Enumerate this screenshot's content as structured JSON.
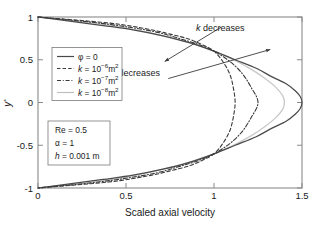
{
  "chart_data": {
    "type": "line",
    "title": "",
    "xlabel": "Scaled axial velocity",
    "ylabel": "y*",
    "xlim": [
      0,
      1.5
    ],
    "ylim": [
      -1,
      1
    ],
    "xticks": [
      "0",
      "0.5",
      "1",
      "1.5"
    ],
    "xtick_values": [
      0,
      0.5,
      1,
      1.5
    ],
    "yticks": [
      "1",
      "0.5",
      "0",
      "-0.5",
      "-1"
    ],
    "ytick_values": [
      1,
      0.5,
      0,
      -0.5,
      -1
    ],
    "grid": false,
    "legend_position": "upper-left",
    "series": [
      {
        "name": "phi = 0",
        "label_main": "φ = 0",
        "style": "solid",
        "color": "#4a4a4a",
        "peak_velocity": 1.5,
        "x": [
          0.0,
          0.19,
          0.37,
          0.54,
          0.71,
          0.86,
          1.0,
          1.12,
          1.24,
          1.33,
          1.41,
          1.46,
          1.49,
          1.5,
          1.49,
          1.46,
          1.41,
          1.33,
          1.24,
          1.12,
          1.0,
          0.86,
          0.71,
          0.54,
          0.37,
          0.19,
          0.0
        ],
        "y": [
          1.0,
          0.95,
          0.9,
          0.85,
          0.78,
          0.7,
          0.6,
          0.5,
          0.4,
          0.3,
          0.22,
          0.14,
          0.07,
          0.0,
          -0.07,
          -0.14,
          -0.22,
          -0.3,
          -0.4,
          -0.5,
          -0.6,
          -0.7,
          -0.78,
          -0.85,
          -0.9,
          -0.95,
          -1.0
        ]
      },
      {
        "name": "k = 1e-6 m2",
        "label_prefix": "k",
        "label_eq": " = 10",
        "label_exp": "−6",
        "label_unit": "m",
        "label_unit_exp": "2",
        "style": "dashed",
        "color": "#3a3a3a",
        "peak_velocity": 1.12,
        "x": [
          0.0,
          0.4,
          0.62,
          0.75,
          0.86,
          0.94,
          1.0,
          1.05,
          1.09,
          1.11,
          1.12,
          1.11,
          1.09,
          1.05,
          1.0,
          0.94,
          0.86,
          0.75,
          0.62,
          0.4,
          0.0
        ],
        "y": [
          1.0,
          0.93,
          0.86,
          0.8,
          0.74,
          0.67,
          0.6,
          0.48,
          0.33,
          0.17,
          0.0,
          -0.17,
          -0.33,
          -0.48,
          -0.6,
          -0.67,
          -0.74,
          -0.8,
          -0.86,
          -0.93,
          -1.0
        ]
      },
      {
        "name": "k = 1e-7 m2",
        "label_prefix": "k",
        "label_eq": " = 10",
        "label_exp": "−7",
        "label_unit": "m",
        "label_unit_exp": "2",
        "style": "dashdot",
        "color": "#3a3a3a",
        "peak_velocity": 1.25,
        "x": [
          0.0,
          0.3,
          0.52,
          0.68,
          0.8,
          0.91,
          1.0,
          1.09,
          1.16,
          1.21,
          1.25,
          1.21,
          1.16,
          1.09,
          1.0,
          0.91,
          0.8,
          0.68,
          0.52,
          0.3,
          0.0
        ],
        "y": [
          1.0,
          0.94,
          0.88,
          0.82,
          0.75,
          0.68,
          0.6,
          0.48,
          0.34,
          0.18,
          0.0,
          -0.18,
          -0.34,
          -0.48,
          -0.6,
          -0.68,
          -0.75,
          -0.82,
          -0.88,
          -0.94,
          -1.0
        ]
      },
      {
        "name": "k = 1e-8 m2",
        "label_prefix": "k",
        "label_eq": " = 10",
        "label_exp": "−8",
        "label_unit": "m",
        "label_unit_exp": "2",
        "style": "solid-light",
        "color": "#c8c8c8",
        "peak_velocity": 1.4,
        "x": [
          0.0,
          0.22,
          0.42,
          0.58,
          0.73,
          0.87,
          1.0,
          1.11,
          1.21,
          1.29,
          1.35,
          1.39,
          1.4,
          1.39,
          1.35,
          1.29,
          1.21,
          1.11,
          1.0,
          0.87,
          0.73,
          0.58,
          0.42,
          0.22,
          0.0
        ],
        "y": [
          1.0,
          0.95,
          0.9,
          0.84,
          0.77,
          0.69,
          0.6,
          0.5,
          0.39,
          0.28,
          0.18,
          0.08,
          0.0,
          -0.08,
          -0.18,
          -0.28,
          -0.39,
          -0.5,
          -0.6,
          -0.69,
          -0.77,
          -0.84,
          -0.9,
          -0.95,
          -1.0
        ]
      }
    ],
    "annotations": [
      {
        "id": "k-decreases-top",
        "text_prefix": "k",
        "text_rest": " decreases",
        "tail": [
          1.04,
          0.88
        ],
        "head": [
          0.72,
          0.48
        ]
      },
      {
        "id": "k-decreases-bottom",
        "text_prefix": "k",
        "text_rest": " decreases",
        "tail": [
          0.74,
          0.28
        ],
        "head": [
          1.32,
          0.62
        ]
      }
    ],
    "parameter_box": [
      {
        "name": "Re",
        "value": " = 0.5",
        "italic": false
      },
      {
        "name": "α",
        "value": " = 1",
        "italic": false
      },
      {
        "name": "h",
        "value": " = 0.001 m",
        "italic": true
      }
    ]
  },
  "axes": {
    "xlabel": "Scaled axial velocity",
    "ylabel_base": "y",
    "ylabel_sup": "*"
  }
}
